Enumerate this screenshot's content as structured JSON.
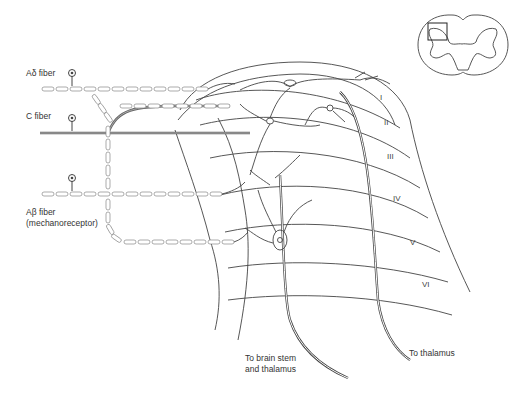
{
  "fibers": [
    {
      "label": "Aδ fiber",
      "type": "myelinated"
    },
    {
      "label": "C fiber",
      "type": "unmyelinated"
    },
    {
      "label": "Aβ fiber",
      "sublabel": "(mechanoreceptor)",
      "type": "myelinated"
    }
  ],
  "laminae": [
    "I",
    "II",
    "III",
    "IV",
    "V",
    "VI"
  ],
  "outputs": [
    {
      "label_line1": "To brain stem",
      "label_line2": "and thalamus"
    },
    {
      "label_line1": "To thalamus"
    }
  ],
  "inset": {
    "description": "spinal cord cross-section with dorsal horn region boxed"
  }
}
